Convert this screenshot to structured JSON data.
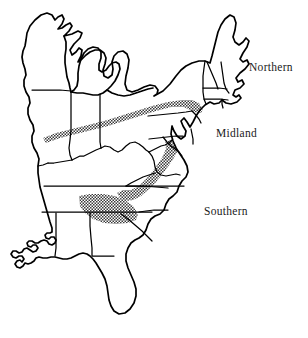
{
  "figure": {
    "kind": "dialect-region-map",
    "background_color": "#ffffff",
    "line_color": "#000000",
    "stipple_color": "#3a3a3a",
    "label_color": "#1a1a1a"
  },
  "labels": {
    "northern": "Northern",
    "midland": "Midland",
    "southern": "Southern"
  },
  "legend_notes": {
    "stipple_band_north": "Northern–Midland transition band",
    "stipple_band_south": "Midland–Southern transition band"
  }
}
